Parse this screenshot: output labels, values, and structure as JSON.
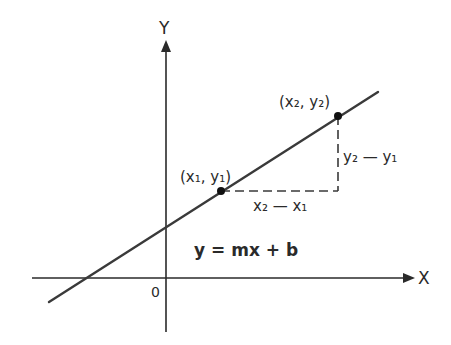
{
  "diagram": {
    "colors": {
      "line": "#3a3a3a",
      "axis": "#2a2a2a",
      "text": "#2a2a2a",
      "background": "#ffffff"
    },
    "axes": {
      "x_label": "X",
      "y_label": "Y",
      "origin_label": "0"
    },
    "points": [
      {
        "label": "(x₁, y₁)",
        "name": "point-1"
      },
      {
        "label": "(x₂, y₂)",
        "name": "point-2"
      }
    ],
    "annotations": {
      "run": "x₂ — x₁",
      "rise": "y₂ — y₁"
    },
    "equation": "y = mx + b"
  }
}
